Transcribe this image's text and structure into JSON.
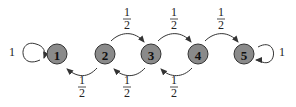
{
  "diagram": {
    "type": "markov-chain",
    "nodes": [
      {
        "id": "1",
        "label": "1",
        "x": 57,
        "y": 54
      },
      {
        "id": "2",
        "label": "2",
        "x": 105,
        "y": 54
      },
      {
        "id": "3",
        "label": "3",
        "x": 151,
        "y": 54
      },
      {
        "id": "4",
        "label": "4",
        "x": 198,
        "y": 54
      },
      {
        "id": "5",
        "label": "5",
        "x": 244,
        "y": 54
      }
    ],
    "edges": [
      {
        "from": "1",
        "to": "1",
        "label": "1"
      },
      {
        "from": "2",
        "to": "1",
        "label_num": "1",
        "label_den": "2"
      },
      {
        "from": "2",
        "to": "3",
        "label_num": "1",
        "label_den": "2"
      },
      {
        "from": "3",
        "to": "2",
        "label_num": "1",
        "label_den": "2"
      },
      {
        "from": "3",
        "to": "4",
        "label_num": "1",
        "label_den": "2"
      },
      {
        "from": "4",
        "to": "3",
        "label_num": "1",
        "label_den": "2"
      },
      {
        "from": "4",
        "to": "5",
        "label_num": "1",
        "label_den": "2"
      },
      {
        "from": "5",
        "to": "5",
        "label": "1"
      }
    ]
  }
}
